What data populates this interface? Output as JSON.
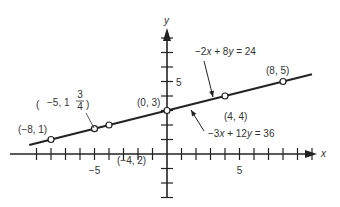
{
  "chart_data": {
    "type": "line",
    "title": "",
    "xlabel": "x",
    "ylabel": "y",
    "xlim": [
      -11,
      11
    ],
    "ylim": [
      -4,
      9
    ],
    "grid": false,
    "x_ticks": [
      -9,
      -8,
      -7,
      -6,
      -5,
      -4,
      -3,
      -2,
      -1,
      1,
      2,
      3,
      4,
      5,
      6,
      7,
      8,
      9,
      10
    ],
    "y_ticks": [
      -3,
      -2,
      -1,
      1,
      2,
      3,
      4,
      5,
      6,
      7,
      8
    ],
    "x_tick_labels": [
      {
        "value": -5,
        "label": "−5"
      },
      {
        "value": 5,
        "label": "5"
      }
    ],
    "y_tick_labels": [
      {
        "value": 5,
        "label": "5"
      }
    ],
    "series": [
      {
        "name": "line",
        "x": [
          -9.5,
          10
        ],
        "y": [
          0.625,
          5.5
        ]
      }
    ],
    "points": [
      {
        "x": -8,
        "y": 1,
        "label": "(−8, 1)"
      },
      {
        "x": -5,
        "y": 1.75,
        "label_pre": "−5, 1",
        "frac_num": "3",
        "frac_den": "4"
      },
      {
        "x": -4,
        "y": 2,
        "label": "(−4, 2)"
      },
      {
        "x": 0,
        "y": 3,
        "label": "(0, 3)"
      },
      {
        "x": 4,
        "y": 4,
        "label": "(4, 4)"
      },
      {
        "x": 8,
        "y": 5,
        "label": "(8, 5)"
      }
    ],
    "annotations": [
      {
        "text_parts": [
          "−2",
          "x",
          " + 8",
          "y",
          " = 24"
        ],
        "points_to": [
          3,
          3.75
        ]
      },
      {
        "text_parts": [
          "−3",
          "x",
          " + 12",
          "y",
          " = 36"
        ],
        "points_to": [
          2,
          3.5
        ]
      }
    ]
  },
  "axis_labels": {
    "x": "x",
    "y": "y"
  }
}
